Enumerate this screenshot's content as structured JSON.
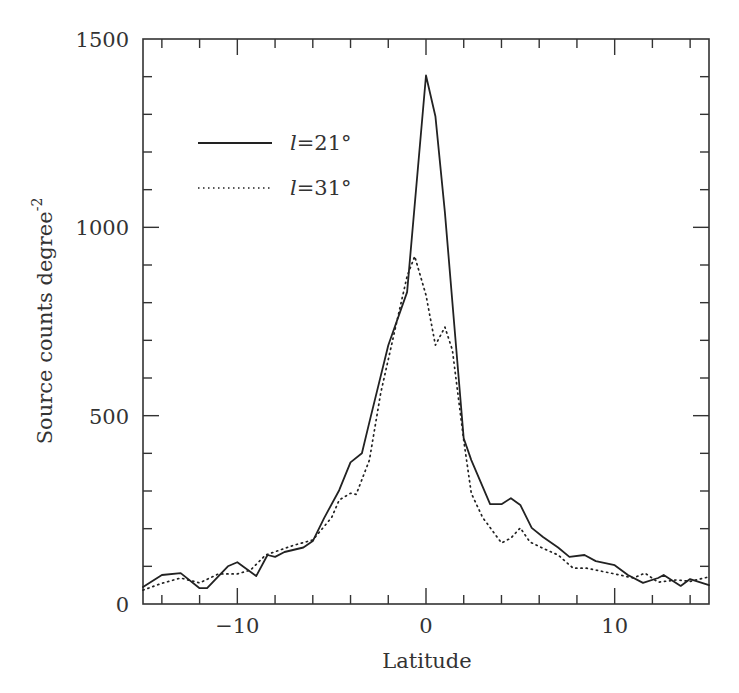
{
  "chart_data": {
    "type": "line",
    "title": "",
    "xlabel": "Latitude",
    "ylabel": "Source counts degree",
    "ylabel_superscript": "-2",
    "xlim": [
      -15,
      15
    ],
    "ylim": [
      0,
      1500
    ],
    "x_ticks_major": [
      -10,
      0,
      10
    ],
    "x_tick_labels": [
      "−10",
      "0",
      "10"
    ],
    "x_ticks_minor_step": 2,
    "y_ticks_major": [
      0,
      500,
      1000,
      1500
    ],
    "y_tick_labels": [
      "0",
      "500",
      "1000",
      "1500"
    ],
    "y_ticks_minor_step": 100,
    "grid": false,
    "legend_position": "upper-left",
    "series": [
      {
        "name": "l=21°",
        "legend_var": "l",
        "legend_value": "=21°",
        "style": "solid",
        "color": "#222222",
        "x": [
          -15,
          -14,
          -13,
          -12,
          -11.6,
          -10.5,
          -10,
          -9,
          -8.4,
          -8,
          -7.5,
          -6.5,
          -6,
          -5.4,
          -4.6,
          -4,
          -3.4,
          -3,
          -2,
          -1,
          0,
          0.5,
          1,
          2,
          2.4,
          3.4,
          4,
          4.5,
          5,
          5.6,
          6.2,
          7,
          7.6,
          8.4,
          9,
          10,
          10.7,
          11.5,
          12.3,
          12.6,
          13.5,
          14,
          15
        ],
        "y": [
          45,
          77,
          82,
          42,
          42,
          100,
          111,
          74,
          130,
          125,
          138,
          150,
          167,
          228,
          302,
          376,
          400,
          483,
          687,
          828,
          1403,
          1295,
          1040,
          440,
          382,
          265,
          265,
          281,
          263,
          202,
          178,
          150,
          125,
          130,
          114,
          103,
          77,
          56,
          69,
          77,
          48,
          66,
          50
        ]
      },
      {
        "name": "l=31°",
        "legend_var": "l",
        "legend_value": "=31°",
        "style": "dotted",
        "color": "#222222",
        "x": [
          -15,
          -14,
          -13,
          -12,
          -11,
          -10,
          -9.3,
          -8.5,
          -7,
          -6,
          -5,
          -4.6,
          -4,
          -3.7,
          -3,
          -2.4,
          -1.5,
          -1,
          -0.6,
          0,
          0.5,
          1,
          1.4,
          2,
          2.4,
          3,
          4,
          4.5,
          5,
          5.5,
          6.2,
          7,
          7.8,
          8.5,
          9,
          10,
          11,
          11.6,
          12.3,
          13.3,
          14,
          15
        ],
        "y": [
          37,
          55,
          69,
          56,
          80,
          80,
          90,
          130,
          156,
          170,
          230,
          276,
          294,
          291,
          382,
          560,
          760,
          870,
          923,
          820,
          687,
          735,
          674,
          435,
          294,
          230,
          162,
          175,
          202,
          165,
          148,
          130,
          95,
          95,
          90,
          80,
          69,
          82,
          58,
          64,
          60,
          72
        ]
      }
    ]
  }
}
